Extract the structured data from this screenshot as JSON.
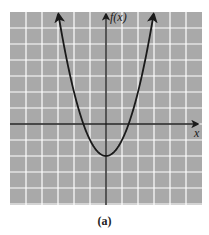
{
  "figure": {
    "caption": "(a)"
  },
  "colors": {
    "plot_background": "#a9a9a9",
    "grid": "#ffffff",
    "axis": "#1a1a1a",
    "curve": "#1a1a1a",
    "page_background": "#ffffff"
  },
  "chart_data": {
    "type": "line",
    "title": "",
    "function": "f(x) = x^2 - 2",
    "xlabel": "x",
    "ylabel": "f(x)",
    "xlim": [
      -6,
      6
    ],
    "ylim": [
      -5,
      7
    ],
    "grid": true,
    "grid_step": 1,
    "tick_labels": false,
    "legend": null,
    "annotations": [
      "f(x)",
      "x",
      "(a)"
    ],
    "vertex": {
      "x": 0,
      "y": -2
    },
    "x_intercepts": [
      -1.414,
      1.414
    ],
    "y_intercept": -2,
    "series": [
      {
        "name": "f(x)",
        "x": [
          -2.98,
          -2.5,
          -2,
          -1.5,
          -1.414,
          -1,
          -0.5,
          0,
          0.5,
          1,
          1.414,
          1.5,
          2,
          2.5,
          2.98
        ],
        "y": [
          6.88,
          4.25,
          2,
          0.25,
          0,
          -1,
          -1.75,
          -2,
          -1.75,
          -1,
          0,
          0.25,
          2,
          4.25,
          6.88
        ],
        "arrows_at_ends": true
      }
    ]
  },
  "layout": {
    "plot": {
      "left": 10,
      "top": 12,
      "right": 202,
      "bottom": 205
    },
    "origin_px": {
      "x": 106,
      "y": 124
    },
    "unit_px": 16
  }
}
